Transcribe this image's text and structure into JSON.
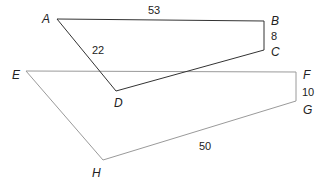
{
  "figure": {
    "polygon1": {
      "vertices": [
        "A",
        "B",
        "C",
        "D"
      ],
      "stroke": "#333333",
      "side_labels": {
        "AB": "53",
        "BC": "8",
        "AD": "22"
      }
    },
    "polygon2": {
      "vertices": [
        "E",
        "F",
        "G",
        "H"
      ],
      "stroke": "#999999",
      "side_labels": {
        "FG": "10",
        "GH": "50"
      }
    },
    "labels": {
      "A": "A",
      "B": "B",
      "C": "C",
      "D": "D",
      "E": "E",
      "F": "F",
      "G": "G",
      "H": "H"
    },
    "measures": {
      "ab": "53",
      "bc": "8",
      "ad": "22",
      "fg": "10",
      "gh": "50"
    }
  }
}
